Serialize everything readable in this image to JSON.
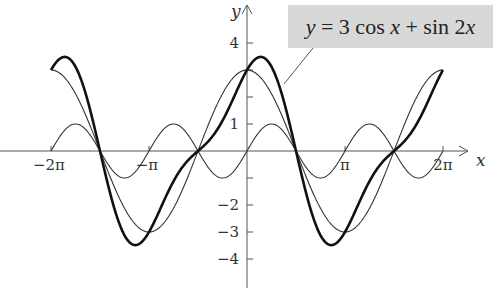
{
  "chart_data": {
    "type": "line",
    "xlabel": "x",
    "ylabel": "y",
    "xlim": [
      -6.2832,
      6.2832
    ],
    "ylim": [
      -4.5,
      4.5
    ],
    "grid": false,
    "legend": "callout box top-right pointing to thick curve",
    "x_ticks": [
      {
        "value": -6.2832,
        "label": "−2π"
      },
      {
        "value": -3.1416,
        "label": "−π"
      },
      {
        "value": 3.1416,
        "label": "π"
      },
      {
        "value": 6.2832,
        "label": "2π"
      }
    ],
    "y_ticks": [
      {
        "value": 4,
        "label": "4"
      },
      {
        "value": 3,
        "label": ""
      },
      {
        "value": 2,
        "label": ""
      },
      {
        "value": 1,
        "label": "1"
      },
      {
        "value": -1,
        "label": ""
      },
      {
        "value": -2,
        "label": "−2"
      },
      {
        "value": -3,
        "label": "−3"
      },
      {
        "value": -4,
        "label": "−4"
      }
    ],
    "series": [
      {
        "name": "3 cos x",
        "expr": "3cos(x)",
        "a": 3,
        "fn": "cos",
        "k": 1,
        "style": "thin",
        "peak": 3,
        "trough": -3
      },
      {
        "name": "sin 2x",
        "expr": "sin(2x)",
        "a": 1,
        "fn": "sin",
        "k": 2,
        "style": "thin",
        "peak": 1,
        "trough": -1
      },
      {
        "name": "3 cos x + sin 2x",
        "expr": "3cos(x)+sin(2x)",
        "style": "thick",
        "peak": 3.4,
        "trough": -3.4
      }
    ]
  },
  "labels": {
    "formula_y": "y",
    "formula_mid": " = 3 cos ",
    "formula_x": "x",
    "formula_plus": " + sin 2",
    "formula_x2": "x"
  }
}
